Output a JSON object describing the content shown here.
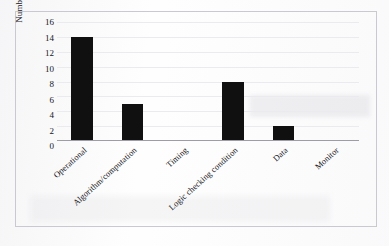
{
  "chart_data": {
    "type": "bar",
    "title": "",
    "subtitle": "",
    "xlabel": "",
    "ylabel": "Number of Errors",
    "categories": [
      "Operational",
      "Algorithm/computation",
      "Timing",
      "Logic checking condition",
      "Data",
      "Monitor"
    ],
    "values": [
      14,
      5,
      0,
      8,
      2,
      0
    ],
    "ylim": [
      0,
      16
    ],
    "ytick_labels": [
      "16",
      "14",
      "12",
      "10",
      "8",
      "6",
      "4",
      "2",
      "0"
    ],
    "ytick_values": [
      16,
      14,
      12,
      10,
      8,
      6,
      4,
      2,
      0
    ],
    "ytick_step": 2,
    "grid": true,
    "grid_axis": "y",
    "legend": false,
    "legend_position": "none",
    "bar_color": "#101010",
    "grid_color": "#ebebef",
    "axis_color": "#9d9da4",
    "frame_color": "#c9c9cf",
    "background_color": "#fefefe",
    "xlabel_rotation_deg": -42
  }
}
